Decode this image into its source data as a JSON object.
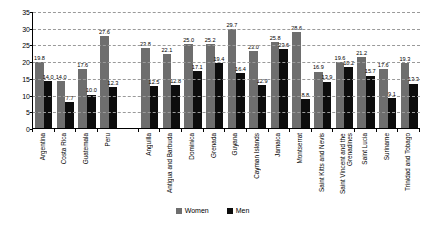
{
  "chart_data": {
    "type": "bar",
    "title": "",
    "xlabel": "",
    "ylabel": "",
    "ylim": [
      0,
      35
    ],
    "ytick_step": 5,
    "yticks": [
      0,
      5,
      10,
      15,
      20,
      25,
      30,
      35
    ],
    "grid": true,
    "legend_position": "bottom",
    "categories": [
      "Argentina",
      "Costa Rica",
      "Guatemala",
      "Peru",
      "Anguilla",
      "Antigua and Barbuda",
      "Dominica",
      "Grenada",
      "Guyana",
      "Cayman Islands",
      "Jamaica",
      "Montserrat",
      "Saint Kitts and Nevis",
      "Saint Vincent and the Grenadines",
      "Saint Lucia",
      "Suriname",
      "Trinidad and Tobago"
    ],
    "group_break_after_index": 3,
    "series": [
      {
        "name": "Women",
        "color": "#6e6e6e",
        "values": [
          19.8,
          14.0,
          17.6,
          27.6,
          23.8,
          22.1,
          25.0,
          25.2,
          29.7,
          23.0,
          25.8,
          28.6,
          16.9,
          19.6,
          21.2,
          17.6,
          19.3
        ]
      },
      {
        "name": "Men",
        "color": "#0d0d0d",
        "values": [
          14.0,
          7.7,
          10.0,
          12.3,
          12.5,
          12.8,
          17.1,
          19.4,
          16.4,
          12.9,
          23.6,
          8.8,
          13.9,
          18.2,
          15.7,
          9.1,
          13.3
        ]
      }
    ]
  },
  "legend": {
    "items": [
      {
        "label": "Women",
        "color": "#6e6e6e"
      },
      {
        "label": "Men",
        "color": "#0d0d0d"
      }
    ]
  }
}
